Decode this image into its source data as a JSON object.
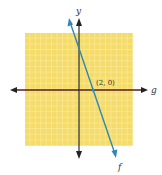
{
  "diagram": {
    "type": "coordinate-plane",
    "colors": {
      "grid_fill": "#f5dc6a",
      "grid_lines": "#fbeeb0",
      "x_axis": "#5a1e14",
      "y_axis": "#2a2a2a",
      "line_f": "#2f86b8",
      "text": "#333333"
    },
    "axes": {
      "y_label": "y",
      "x_line_label": "g"
    },
    "line_f": {
      "label": "f",
      "x_intercept_label": "(2, 0)"
    }
  }
}
